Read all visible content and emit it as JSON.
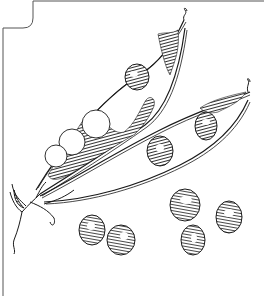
{
  "illustration": {
    "subject": "pea pods with peas",
    "style": "pen-and-ink line drawing",
    "colors": {
      "ink": "#1a1a1a",
      "background": "#ffffff",
      "frame": "#555555"
    },
    "pods": [
      {
        "name": "upper-pod",
        "open": true,
        "peas_inside": 4
      },
      {
        "name": "lower-pod",
        "open": true,
        "peas_inside": 3
      }
    ],
    "loose_peas": 6
  }
}
